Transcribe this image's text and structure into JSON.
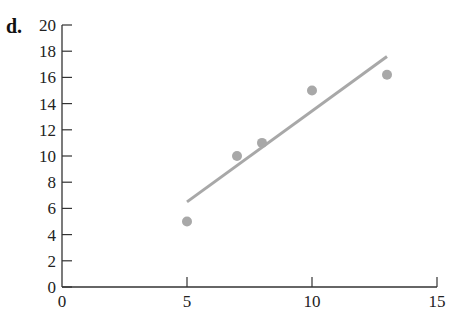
{
  "panel_label": "d.",
  "colors": {
    "axis": "#333333",
    "points": "#a8a8a8",
    "line": "#a8a8a8"
  },
  "chart_data": {
    "type": "scatter",
    "title": "",
    "xlabel": "",
    "ylabel": "",
    "xlim": [
      0,
      15
    ],
    "ylim": [
      0,
      20
    ],
    "x_ticks": [
      "0",
      "5",
      "10",
      "15"
    ],
    "y_ticks": [
      "0",
      "2",
      "4",
      "6",
      "8",
      "10",
      "12",
      "14",
      "16",
      "18",
      "20"
    ],
    "grid": false,
    "legend": null,
    "series": [
      {
        "name": "data",
        "type": "scatter",
        "points": [
          [
            5,
            5
          ],
          [
            7,
            10
          ],
          [
            8,
            11
          ],
          [
            10,
            15
          ],
          [
            13,
            16.2
          ]
        ]
      },
      {
        "name": "fit line",
        "type": "line",
        "points": [
          [
            5,
            6.5
          ],
          [
            13,
            17.6
          ]
        ]
      }
    ]
  }
}
